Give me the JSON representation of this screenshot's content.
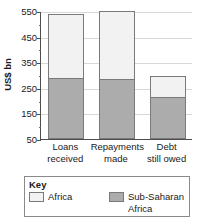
{
  "chart_data": {
    "type": "bar",
    "title": "",
    "subtitle": "",
    "stacked": false,
    "overlay_note": "Sub-Saharan Africa is drawn inside / in front of the Africa total bar",
    "xlabel": "",
    "ylabel": "US$ bn",
    "ylim": [
      50,
      550
    ],
    "ytick_step": 100,
    "yminor_step": 50,
    "grid": true,
    "legend_position": "bottom",
    "categories": [
      "Loans received",
      "Repayments made",
      "Debt still owed"
    ],
    "category_lines": [
      [
        "Loans",
        "received"
      ],
      [
        "Repayments",
        "made"
      ],
      [
        "Debt",
        "still owed"
      ]
    ],
    "yticks": [
      550,
      450,
      350,
      250,
      150,
      50
    ],
    "ytick_labels": [
      "550",
      "450",
      "350",
      "250",
      "150",
      "50"
    ],
    "series": [
      {
        "name": "Africa",
        "color": "#f2f2f2",
        "values": [
          540,
          550,
          295
        ]
      },
      {
        "name": "Sub-Saharan Africa",
        "color": "#acacac",
        "values": [
          290,
          285,
          215
        ]
      }
    ]
  },
  "axis": {
    "y_title": "US$ bn"
  },
  "legend": {
    "title": "Key",
    "entries": [
      {
        "label": "Africa",
        "lines": [
          "Africa"
        ],
        "color": "#f2f2f2"
      },
      {
        "label": "Sub-Saharan Africa",
        "lines": [
          "Sub-Saharan",
          "Africa"
        ],
        "color": "#acacac"
      }
    ]
  },
  "colors": {
    "africa": "#f2f2f2",
    "sub_saharan_africa": "#acacac",
    "bar_outline": "#7a7a7a",
    "axis": "#4d4d4d",
    "gridline": "#d8d8d8",
    "legend_border": "#8a8a8a",
    "text": "#1a1a1a",
    "background": "#ffffff"
  }
}
